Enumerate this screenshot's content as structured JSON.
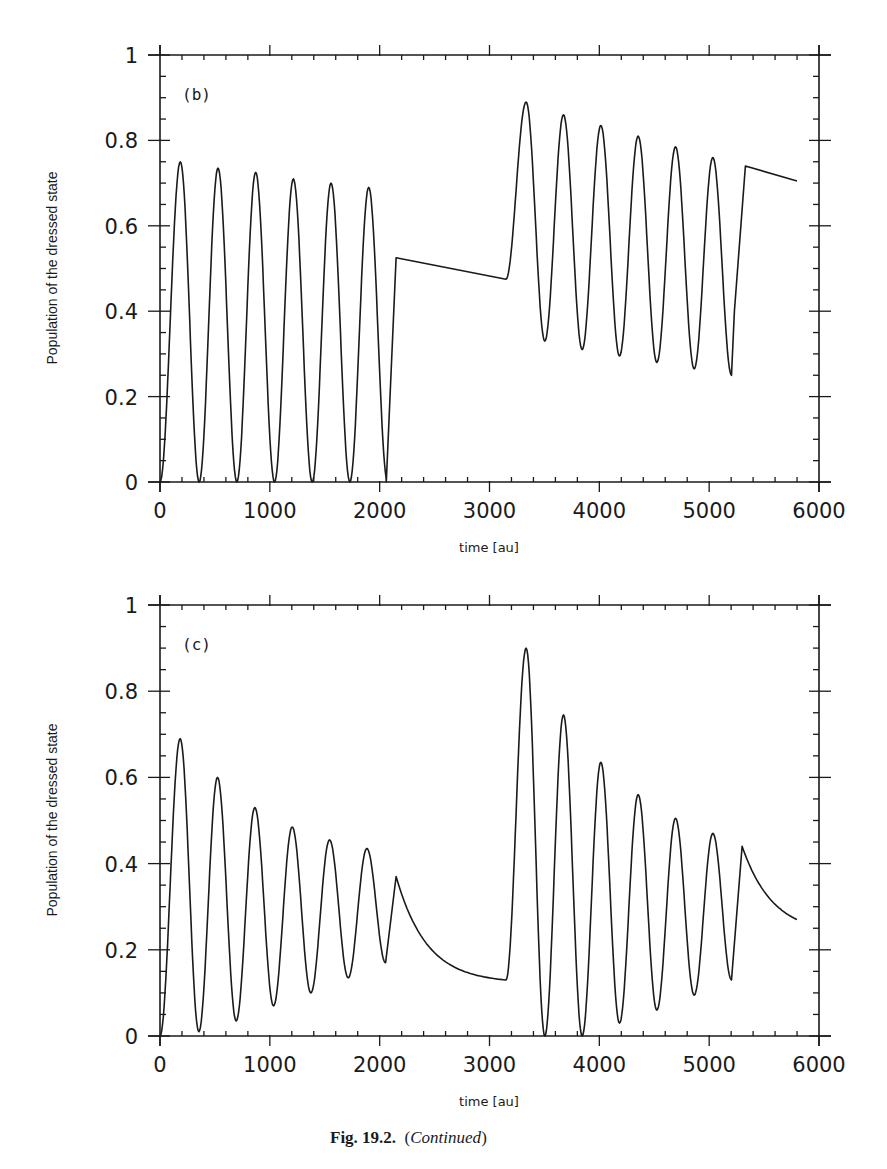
{
  "caption": {
    "figure": "Fig. 19.2.",
    "note_open": "(",
    "note": "Continued",
    "note_close": ")"
  },
  "chart_data": [
    {
      "type": "line",
      "panel_label": "(b)",
      "title": "",
      "xlabel": "time [au]",
      "ylabel": "Population of the dressed state",
      "xlim": [
        0,
        6000
      ],
      "ylim": [
        0,
        1
      ],
      "xticks": [
        0,
        1000,
        2000,
        3000,
        4000,
        5000,
        6000
      ],
      "xtick_labels": [
        "0",
        "1000",
        "2000",
        "3000",
        "4000",
        "5000",
        "6000"
      ],
      "yticks": [
        0,
        0.2,
        0.4,
        0.6,
        0.8,
        1
      ],
      "ytick_labels": [
        "0",
        "0.2",
        "0.4",
        "0.6",
        "0.8",
        "1"
      ],
      "grid": false,
      "legend": "none",
      "series": [
        {
          "name": "population",
          "segments": [
            {
              "kind": "osc",
              "t0": 0,
              "t1": 2060,
              "period": 343,
              "start": 0.0,
              "peaks": [
                0.75,
                0.735,
                0.725,
                0.71,
                0.7,
                0.69
              ],
              "troughs": [
                0.0,
                0.0,
                0.0,
                0.0,
                0.0,
                0.0
              ]
            },
            {
              "kind": "line",
              "points": [
                [
                  2060,
                  0.0
                ],
                [
                  2150,
                  0.525
                ]
              ]
            },
            {
              "kind": "line",
              "points": [
                [
                  2150,
                  0.525
                ],
                [
                  3150,
                  0.475
                ]
              ]
            },
            {
              "kind": "osc",
              "t0": 3150,
              "t1": 5300,
              "period": 340,
              "start": 0.475,
              "peaks": [
                0.89,
                0.86,
                0.835,
                0.81,
                0.785,
                0.76
              ],
              "troughs": [
                0.33,
                0.31,
                0.295,
                0.28,
                0.265,
                0.25
              ]
            },
            {
              "kind": "line",
              "points": [
                [
                  5230,
                  0.4
                ],
                [
                  5330,
                  0.74
                ]
              ]
            },
            {
              "kind": "line",
              "points": [
                [
                  5330,
                  0.74
                ],
                [
                  5800,
                  0.705
                ]
              ]
            }
          ],
          "key_points": {
            "t": [
              0,
              190,
              355,
              530,
              700,
              870,
              1040,
              1210,
              1380,
              1545,
              1720,
              1890,
              2060,
              2150,
              3150,
              3290,
              3460,
              3630,
              3800,
              3970,
              4140,
              4310,
              4480,
              4640,
              4820,
              4990,
              5160,
              5330,
              5800
            ],
            "y": [
              0,
              0.75,
              0,
              0.735,
              0,
              0.725,
              0,
              0.71,
              0,
              0.7,
              0,
              0.69,
              0,
              0.525,
              0.475,
              0.89,
              0.33,
              0.86,
              0.31,
              0.835,
              0.295,
              0.81,
              0.28,
              0.785,
              0.265,
              0.76,
              0.25,
              0.74,
              0.705
            ]
          }
        }
      ]
    },
    {
      "type": "line",
      "panel_label": "(c)",
      "title": "",
      "xlabel": "time [au]",
      "ylabel": "Population of the dressed state",
      "xlim": [
        0,
        6000
      ],
      "ylim": [
        0,
        1
      ],
      "xticks": [
        0,
        1000,
        2000,
        3000,
        4000,
        5000,
        6000
      ],
      "xtick_labels": [
        "0",
        "1000",
        "2000",
        "3000",
        "4000",
        "5000",
        "6000"
      ],
      "yticks": [
        0,
        0.2,
        0.4,
        0.6,
        0.8,
        1
      ],
      "ytick_labels": [
        "0",
        "0.2",
        "0.4",
        "0.6",
        "0.8",
        "1"
      ],
      "grid": false,
      "legend": "none",
      "series": [
        {
          "name": "population",
          "segments": [
            {
              "kind": "osc",
              "t0": 0,
              "t1": 2150,
              "period": 340,
              "start": 0.0,
              "peaks": [
                0.69,
                0.6,
                0.53,
                0.485,
                0.455,
                0.435
              ],
              "troughs": [
                0.01,
                0.035,
                0.07,
                0.1,
                0.135,
                0.17
              ]
            },
            {
              "kind": "decay",
              "t0": 2150,
              "t1": 3150,
              "y0": 0.37,
              "y1": 0.13,
              "curv": 1.2
            },
            {
              "kind": "osc",
              "t0": 3150,
              "t1": 5300,
              "period": 340,
              "start": 0.13,
              "peaks": [
                0.9,
                0.745,
                0.635,
                0.56,
                0.505,
                0.47
              ],
              "troughs": [
                0.0,
                0.0,
                0.03,
                0.06,
                0.095,
                0.13
              ]
            },
            {
              "kind": "decay",
              "t0": 5300,
              "t1": 5800,
              "y0": 0.44,
              "y1": 0.27,
              "curv": 0.6
            }
          ],
          "key_points": {
            "t": [
              0,
              190,
              355,
              530,
              700,
              870,
              1040,
              1210,
              1380,
              1545,
              1720,
              1890,
              2050,
              2150,
              3150,
              3290,
              3460,
              3630,
              3800,
              3970,
              4140,
              4310,
              4480,
              4640,
              4820,
              4990,
              5160,
              5300,
              5800
            ],
            "y": [
              0,
              0.69,
              0.01,
              0.6,
              0.035,
              0.53,
              0.07,
              0.485,
              0.1,
              0.455,
              0.135,
              0.435,
              0.17,
              0.37,
              0.13,
              0.9,
              0.0,
              0.745,
              0.0,
              0.635,
              0.03,
              0.56,
              0.06,
              0.505,
              0.095,
              0.47,
              0.13,
              0.44,
              0.27
            ]
          }
        }
      ]
    }
  ]
}
